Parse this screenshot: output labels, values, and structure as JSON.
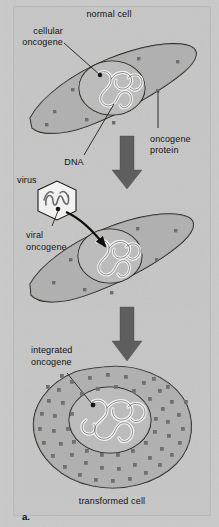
{
  "figure": {
    "panel_label": "a.",
    "title_top": "normal cell",
    "title_bottom": "transformed cell",
    "labels": {
      "cellular_oncogene_line1": "cellular",
      "cellular_oncogene_line2": "oncogene",
      "dna": "DNA",
      "oncogene_protein_line1": "oncogene",
      "oncogene_protein_line2": "protein",
      "virus": "virus",
      "viral_oncogene_line1": "viral",
      "viral_oncogene_line2": "oncogene",
      "integrated_oncogene_line1": "integrated",
      "integrated_oncogene_line2": "oncogene"
    },
    "colors": {
      "page_background": "#c9c9c9",
      "panel_background": "#c6c6c6",
      "panel_border": "#a8a8a8",
      "cytoplasm_fill": "#b0b0b0",
      "nucleus_fill": "#b8b8b8",
      "outline_stroke": "#17140f",
      "protein_dot": "#6e6e6e",
      "transformed_dot": "#707070",
      "arrow_fill": "#5e5e5e",
      "virus_fill": "#f2f2f2",
      "chromatin_fill": "#f0f0f0",
      "text": "#14110f"
    },
    "stages": [
      {
        "name": "normal-cell",
        "protein_dot_count": 8,
        "description": "elongated lens-shaped cell with round nucleus and few oncogene protein dots"
      },
      {
        "name": "virus-infected-cell",
        "protein_dot_count": 7,
        "description": "same cell receiving viral oncogene via black arrow from hexagonal virus"
      },
      {
        "name": "transformed-cell",
        "protein_dot_count": 58,
        "description": "rounded enlarged cell densely filled with oncogene protein dots"
      }
    ],
    "arrows": [
      {
        "name": "flow-arrow-1",
        "direction": "down"
      },
      {
        "name": "flow-arrow-2",
        "direction": "down"
      },
      {
        "name": "virus-infection-arrow",
        "direction": "down-right",
        "style": "black-curved"
      }
    ]
  }
}
